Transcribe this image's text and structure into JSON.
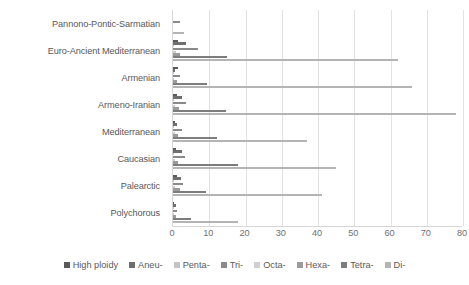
{
  "chart_data": {
    "type": "bar",
    "orientation": "horizontal",
    "title": "",
    "xlabel": "",
    "ylabel": "",
    "xlim": [
      0,
      80
    ],
    "xticks": [
      0,
      10,
      20,
      30,
      40,
      50,
      60,
      70,
      80
    ],
    "grid": true,
    "legend_position": "bottom",
    "categories": [
      "Pannono-Pontic-Sarmatian",
      "Euro-Ancient Mediterranean",
      "Armenian",
      "Armeno-Iranian",
      "Mediterranean",
      "Caucasian",
      "Palearctic",
      "Polychorous"
    ],
    "series": [
      {
        "name": "High ploidy",
        "color": "#5a5a5a",
        "values": [
          0,
          1.5,
          1.5,
          1.0,
          0.6,
          0.8,
          1.0,
          0.4
        ]
      },
      {
        "name": "Aneu-",
        "color": "#6e6e6e",
        "values": [
          0,
          3.5,
          0.5,
          2.5,
          1.2,
          2.5,
          2.2,
          0.8
        ]
      },
      {
        "name": "Penta-",
        "color": "#c4c4c4",
        "values": [
          0,
          0.4,
          0.3,
          0.4,
          0.3,
          0.3,
          0.4,
          0.2
        ]
      },
      {
        "name": "Tri-",
        "color": "#8a8a8a",
        "values": [
          1.8,
          7.0,
          2.0,
          3.6,
          2.4,
          3.2,
          2.8,
          1.2
        ]
      },
      {
        "name": "Octa-",
        "color": "#cfcfcf",
        "values": [
          0,
          0.8,
          0.4,
          0.6,
          0.5,
          0.5,
          0.6,
          0.3
        ]
      },
      {
        "name": "Hexa-",
        "color": "#9b9b9b",
        "values": [
          0,
          2.0,
          1.2,
          1.6,
          1.4,
          1.5,
          1.8,
          0.7
        ]
      },
      {
        "name": "Tetra-",
        "color": "#7d7d7d",
        "values": [
          0,
          15.0,
          9.5,
          14.5,
          12.0,
          18.0,
          9.0,
          5.0
        ]
      },
      {
        "name": "Di-",
        "color": "#b4b4b4",
        "values": [
          3.0,
          62.0,
          66.0,
          78.0,
          37.0,
          45.0,
          41.0,
          18.0
        ]
      }
    ],
    "extra_bars": {
      "Euro-Ancient Mediterranean": [
        63.0,
        66.0
      ],
      "Armenian": [
        78.0
      ],
      "Armeno-Iranian": [
        37.0,
        74.0
      ],
      "Mediterranean": [
        45.0,
        18.0
      ],
      "Caucasian": [
        34.0,
        42.0
      ],
      "Palearctic": [
        45.0,
        18.0
      ],
      "Polychorous": [
        18.0
      ]
    }
  },
  "legend": {
    "items": [
      {
        "label": "High ploidy"
      },
      {
        "label": "Aneu-"
      },
      {
        "label": "Penta-"
      },
      {
        "label": "Tri-"
      },
      {
        "label": "Octa-"
      },
      {
        "label": "Hexa-"
      },
      {
        "label": "Tetra-"
      },
      {
        "label": "Di-"
      }
    ]
  }
}
